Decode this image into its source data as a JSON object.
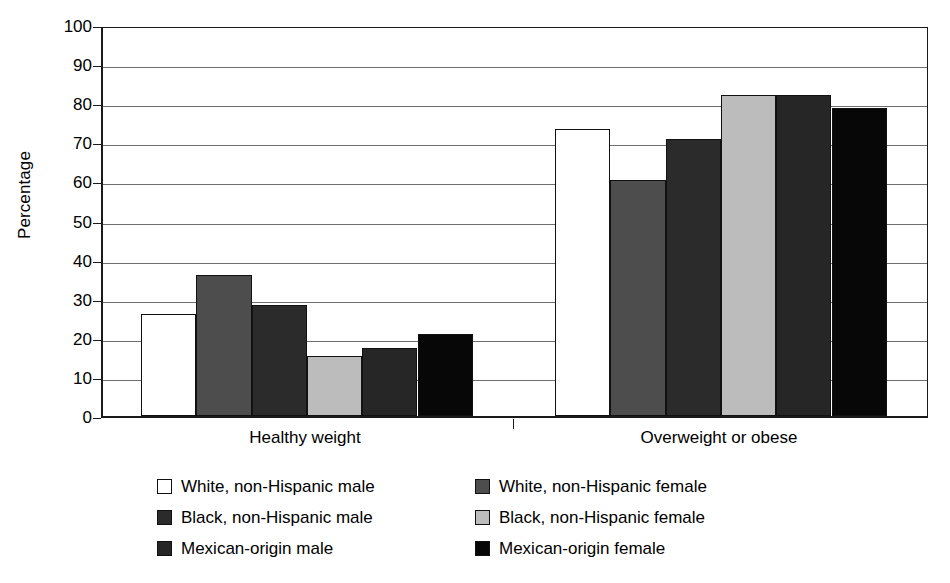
{
  "chart_data": {
    "type": "bar",
    "title": "",
    "xlabel": "",
    "ylabel": "Percentage",
    "ylim": [
      0,
      100
    ],
    "ytick_step": 10,
    "yticks": [
      100,
      90,
      80,
      70,
      60,
      50,
      40,
      30,
      20,
      10,
      0
    ],
    "grid": true,
    "legend_position": "bottom",
    "categories": [
      "Healthy weight",
      "Overweight or obese"
    ],
    "series": [
      {
        "name": "White, non-Hispanic male",
        "color": "#ffffff",
        "values": [
          26.2,
          73.5
        ]
      },
      {
        "name": "White, non-Hispanic female",
        "color": "#4d4d4d",
        "values": [
          36.0,
          60.3
        ]
      },
      {
        "name": "Black, non-Hispanic male",
        "color": "#2b2b2b",
        "values": [
          28.3,
          70.8
        ]
      },
      {
        "name": "Black, non-Hispanic female",
        "color": "#bcbcbc",
        "values": [
          15.4,
          82.0
        ]
      },
      {
        "name": "Mexican-origin male",
        "color": "#262626",
        "values": [
          17.3,
          82.2
        ]
      },
      {
        "name": "Mexican-origin female",
        "color": "#070707",
        "values": [
          21.1,
          78.9
        ]
      }
    ]
  },
  "colors": {
    "axis": "#1a1a1a",
    "grid": "#6f6f6f",
    "background": "#ffffff",
    "text": "#000000"
  }
}
